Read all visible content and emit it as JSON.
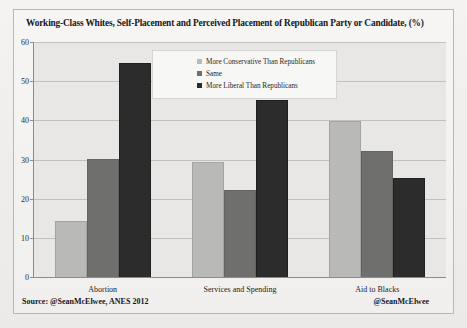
{
  "chart_data": {
    "type": "bar",
    "title": "Working-Class Whites, Self-Placement and Perceived Placement of Republican Party or Candidate, (%)",
    "categories": [
      "Abortion",
      "Services and Spending",
      "Aid to Blacks"
    ],
    "series": [
      {
        "name": "More Conservative Than Republicans",
        "values": [
          14,
          29,
          39.5
        ],
        "color": "#b9b9b7"
      },
      {
        "name": "Same",
        "values": [
          30,
          22,
          32
        ],
        "color": "#6f6f6e"
      },
      {
        "name": "More Liberal Than Republicans",
        "values": [
          54.5,
          45,
          25
        ],
        "color": "#2c2c2d"
      }
    ],
    "xlabel": "",
    "ylabel": "",
    "ylim": [
      0,
      60
    ],
    "yticks": [
      0,
      10,
      20,
      30,
      40,
      50,
      60
    ],
    "grid": true,
    "legend_position": "top-center"
  },
  "footer": {
    "source": "Source: @SeanMcElwee, ANES 2012",
    "handle": "@SeanMcElwee"
  }
}
